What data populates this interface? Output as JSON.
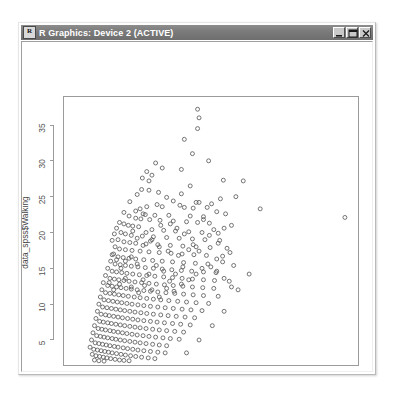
{
  "window": {
    "title": "R Graphics: Device 2 (ACTIVE)",
    "icon": "r-logo-icon",
    "controls": [
      {
        "name": "minimize-button",
        "glyph": "minimize-icon"
      },
      {
        "name": "maximize-button",
        "glyph": "maximize-icon"
      },
      {
        "name": "close-button",
        "glyph": "close-icon"
      }
    ]
  },
  "chart_data": {
    "type": "scatter",
    "title": "",
    "xlabel": "data_spss$Success",
    "ylabel": "data_spss$Walking",
    "xlim": [
      -12,
      388
    ],
    "ylim": [
      1.5,
      39
    ],
    "xticks": [
      0,
      50,
      100,
      150,
      200,
      250,
      300,
      350
    ],
    "yticks": [
      5,
      10,
      15,
      20,
      25,
      30,
      35
    ],
    "grid": false,
    "legend": null,
    "marker": "open-circle",
    "marker_color": "#5a5a5a",
    "points": [
      [
        170,
        37.2
      ],
      [
        172,
        36.0
      ],
      [
        170,
        34.5
      ],
      [
        152,
        33.0
      ],
      [
        163,
        31.0
      ],
      [
        185,
        30.0
      ],
      [
        113,
        29.7
      ],
      [
        122,
        29.0
      ],
      [
        148,
        28.8
      ],
      [
        101,
        28.5
      ],
      [
        108,
        28.0
      ],
      [
        95,
        27.6
      ],
      [
        104,
        27.2
      ],
      [
        205,
        27.3
      ],
      [
        232,
        27.2
      ],
      [
        160,
        26.5
      ],
      [
        94,
        26.0
      ],
      [
        104,
        25.9
      ],
      [
        88,
        25.3
      ],
      [
        222,
        25.0
      ],
      [
        201,
        24.7
      ],
      [
        78,
        24.3
      ],
      [
        168,
        24.2
      ],
      [
        172,
        24.2
      ],
      [
        189,
        24.0
      ],
      [
        146,
        23.8
      ],
      [
        115,
        23.9
      ],
      [
        101,
        23.6
      ],
      [
        122,
        23.6
      ],
      [
        152,
        23.5
      ],
      [
        164,
        23.4
      ],
      [
        183,
        23.5
      ],
      [
        255,
        23.3
      ],
      [
        370,
        22.1
      ],
      [
        196,
        22.9
      ],
      [
        208,
        22.6
      ],
      [
        96,
        22.6
      ],
      [
        99,
        22.5
      ],
      [
        112,
        22.4
      ],
      [
        131,
        22.4
      ],
      [
        160,
        22.3
      ],
      [
        178,
        22.2
      ],
      [
        86,
        22.0
      ],
      [
        93,
        21.9
      ],
      [
        105,
        21.8
      ],
      [
        119,
        21.7
      ],
      [
        137,
        21.6
      ],
      [
        155,
        21.5
      ],
      [
        170,
        21.4
      ],
      [
        186,
        21.3
      ],
      [
        216,
        21.0
      ],
      [
        70,
        21.2
      ],
      [
        76,
        21.0
      ],
      [
        82,
        20.9
      ],
      [
        90,
        20.8
      ],
      [
        108,
        20.4
      ],
      [
        124,
        20.3
      ],
      [
        140,
        20.2
      ],
      [
        158,
        20.1
      ],
      [
        176,
        20.0
      ],
      [
        198,
        19.9
      ],
      [
        66,
        20.0
      ],
      [
        72,
        19.8
      ],
      [
        80,
        19.6
      ],
      [
        95,
        19.5
      ],
      [
        110,
        19.4
      ],
      [
        128,
        19.3
      ],
      [
        145,
        19.2
      ],
      [
        163,
        19.1
      ],
      [
        180,
        19.0
      ],
      [
        200,
        18.9
      ],
      [
        62,
        19.0
      ],
      [
        70,
        18.7
      ],
      [
        78,
        18.6
      ],
      [
        86,
        18.5
      ],
      [
        100,
        18.4
      ],
      [
        116,
        18.3
      ],
      [
        133,
        18.2
      ],
      [
        150,
        18.1
      ],
      [
        168,
        18.0
      ],
      [
        187,
        17.9
      ],
      [
        210,
        17.8
      ],
      [
        58,
        18.0
      ],
      [
        64,
        17.7
      ],
      [
        72,
        17.6
      ],
      [
        81,
        17.5
      ],
      [
        92,
        17.4
      ],
      [
        104,
        17.3
      ],
      [
        118,
        17.2
      ],
      [
        134,
        17.1
      ],
      [
        149,
        17.0
      ],
      [
        165,
        16.9
      ],
      [
        182,
        16.8
      ],
      [
        204,
        16.7
      ],
      [
        56,
        17.0
      ],
      [
        62,
        16.6
      ],
      [
        69,
        16.5
      ],
      [
        77,
        16.4
      ],
      [
        86,
        16.3
      ],
      [
        97,
        16.2
      ],
      [
        109,
        16.1
      ],
      [
        122,
        16.0
      ],
      [
        136,
        15.9
      ],
      [
        151,
        15.8
      ],
      [
        167,
        15.7
      ],
      [
        184,
        15.6
      ],
      [
        219,
        15.4
      ],
      [
        52,
        16.0
      ],
      [
        58,
        15.6
      ],
      [
        65,
        15.5
      ],
      [
        72,
        15.4
      ],
      [
        80,
        15.3
      ],
      [
        89,
        15.2
      ],
      [
        99,
        15.1
      ],
      [
        110,
        15.0
      ],
      [
        122,
        14.9
      ],
      [
        135,
        14.8
      ],
      [
        148,
        14.7
      ],
      [
        162,
        14.6
      ],
      [
        178,
        14.5
      ],
      [
        195,
        14.4
      ],
      [
        240,
        14.2
      ],
      [
        48,
        15.0
      ],
      [
        54,
        14.6
      ],
      [
        60,
        14.5
      ],
      [
        67,
        14.4
      ],
      [
        74,
        14.3
      ],
      [
        82,
        14.2
      ],
      [
        91,
        14.1
      ],
      [
        101,
        14.0
      ],
      [
        112,
        13.9
      ],
      [
        124,
        13.8
      ],
      [
        136,
        13.7
      ],
      [
        149,
        13.6
      ],
      [
        163,
        13.5
      ],
      [
        178,
        13.4
      ],
      [
        193,
        13.3
      ],
      [
        213,
        13.2
      ],
      [
        45,
        14.0
      ],
      [
        51,
        13.6
      ],
      [
        57,
        13.5
      ],
      [
        63,
        13.4
      ],
      [
        70,
        13.3
      ],
      [
        77,
        13.2
      ],
      [
        85,
        13.1
      ],
      [
        94,
        13.0
      ],
      [
        104,
        12.9
      ],
      [
        114,
        12.8
      ],
      [
        125,
        12.7
      ],
      [
        137,
        12.6
      ],
      [
        150,
        12.5
      ],
      [
        163,
        12.4
      ],
      [
        177,
        12.3
      ],
      [
        192,
        12.2
      ],
      [
        225,
        12.0
      ],
      [
        42,
        13.0
      ],
      [
        48,
        12.6
      ],
      [
        54,
        12.5
      ],
      [
        60,
        12.4
      ],
      [
        66,
        12.3
      ],
      [
        73,
        12.2
      ],
      [
        80,
        12.1
      ],
      [
        88,
        12.0
      ],
      [
        97,
        11.9
      ],
      [
        106,
        11.8
      ],
      [
        116,
        11.7
      ],
      [
        127,
        11.6
      ],
      [
        139,
        11.5
      ],
      [
        151,
        11.4
      ],
      [
        164,
        11.3
      ],
      [
        178,
        11.2
      ],
      [
        198,
        11.1
      ],
      [
        40,
        12.0
      ],
      [
        45,
        11.6
      ],
      [
        51,
        11.5
      ],
      [
        57,
        11.4
      ],
      [
        63,
        11.3
      ],
      [
        69,
        11.2
      ],
      [
        76,
        11.1
      ],
      [
        84,
        11.0
      ],
      [
        92,
        10.9
      ],
      [
        101,
        10.8
      ],
      [
        110,
        10.7
      ],
      [
        120,
        10.6
      ],
      [
        131,
        10.5
      ],
      [
        143,
        10.4
      ],
      [
        155,
        10.3
      ],
      [
        168,
        10.2
      ],
      [
        185,
        10.1
      ],
      [
        38,
        11.0
      ],
      [
        43,
        10.6
      ],
      [
        49,
        10.5
      ],
      [
        55,
        10.4
      ],
      [
        61,
        10.3
      ],
      [
        67,
        10.2
      ],
      [
        74,
        10.1
      ],
      [
        81,
        10.0
      ],
      [
        89,
        9.9
      ],
      [
        97,
        9.8
      ],
      [
        106,
        9.7
      ],
      [
        116,
        9.6
      ],
      [
        126,
        9.5
      ],
      [
        137,
        9.4
      ],
      [
        149,
        9.3
      ],
      [
        161,
        9.2
      ],
      [
        176,
        9.1
      ],
      [
        206,
        9.0
      ],
      [
        36,
        10.0
      ],
      [
        41,
        9.6
      ],
      [
        47,
        9.5
      ],
      [
        53,
        9.4
      ],
      [
        59,
        9.3
      ],
      [
        65,
        9.2
      ],
      [
        71,
        9.1
      ],
      [
        78,
        9.0
      ],
      [
        85,
        8.9
      ],
      [
        93,
        8.8
      ],
      [
        101,
        8.7
      ],
      [
        110,
        8.6
      ],
      [
        120,
        8.5
      ],
      [
        130,
        8.4
      ],
      [
        141,
        8.3
      ],
      [
        153,
        8.2
      ],
      [
        166,
        8.1
      ],
      [
        34,
        9.0
      ],
      [
        39,
        8.6
      ],
      [
        45,
        8.5
      ],
      [
        50,
        8.4
      ],
      [
        56,
        8.3
      ],
      [
        62,
        8.2
      ],
      [
        68,
        8.1
      ],
      [
        75,
        8.0
      ],
      [
        82,
        7.9
      ],
      [
        89,
        7.8
      ],
      [
        97,
        7.7
      ],
      [
        106,
        7.6
      ],
      [
        115,
        7.5
      ],
      [
        125,
        7.4
      ],
      [
        136,
        7.3
      ],
      [
        147,
        7.2
      ],
      [
        160,
        7.1
      ],
      [
        190,
        7.0
      ],
      [
        32,
        8.0
      ],
      [
        37,
        7.6
      ],
      [
        42,
        7.5
      ],
      [
        48,
        7.4
      ],
      [
        53,
        7.3
      ],
      [
        59,
        7.2
      ],
      [
        65,
        7.1
      ],
      [
        71,
        7.0
      ],
      [
        78,
        6.9
      ],
      [
        85,
        6.8
      ],
      [
        92,
        6.7
      ],
      [
        100,
        6.6
      ],
      [
        109,
        6.5
      ],
      [
        118,
        6.4
      ],
      [
        128,
        6.3
      ],
      [
        139,
        6.2
      ],
      [
        151,
        6.1
      ],
      [
        30,
        7.0
      ],
      [
        35,
        6.6
      ],
      [
        40,
        6.5
      ],
      [
        45,
        6.4
      ],
      [
        51,
        6.3
      ],
      [
        56,
        6.2
      ],
      [
        62,
        6.1
      ],
      [
        68,
        6.0
      ],
      [
        74,
        5.9
      ],
      [
        81,
        5.8
      ],
      [
        88,
        5.7
      ],
      [
        96,
        5.6
      ],
      [
        104,
        5.5
      ],
      [
        113,
        5.4
      ],
      [
        123,
        5.3
      ],
      [
        133,
        5.2
      ],
      [
        145,
        5.1
      ],
      [
        172,
        5.0
      ],
      [
        28,
        6.0
      ],
      [
        33,
        5.6
      ],
      [
        38,
        5.5
      ],
      [
        43,
        5.4
      ],
      [
        48,
        5.3
      ],
      [
        54,
        5.2
      ],
      [
        59,
        5.1
      ],
      [
        65,
        5.0
      ],
      [
        71,
        4.9
      ],
      [
        78,
        4.8
      ],
      [
        85,
        4.7
      ],
      [
        92,
        4.6
      ],
      [
        100,
        4.5
      ],
      [
        109,
        4.4
      ],
      [
        118,
        4.3
      ],
      [
        128,
        4.2
      ],
      [
        26,
        5.0
      ],
      [
        31,
        4.6
      ],
      [
        36,
        4.5
      ],
      [
        41,
        4.4
      ],
      [
        46,
        4.3
      ],
      [
        51,
        4.2
      ],
      [
        57,
        4.1
      ],
      [
        62,
        4.0
      ],
      [
        69,
        3.9
      ],
      [
        75,
        3.8
      ],
      [
        82,
        3.7
      ],
      [
        89,
        3.6
      ],
      [
        97,
        3.5
      ],
      [
        106,
        3.4
      ],
      [
        116,
        3.3
      ],
      [
        126,
        3.2
      ],
      [
        155,
        3.2
      ],
      [
        24,
        4.0
      ],
      [
        29,
        3.7
      ],
      [
        34,
        3.6
      ],
      [
        39,
        3.5
      ],
      [
        44,
        3.4
      ],
      [
        49,
        3.3
      ],
      [
        54,
        3.2
      ],
      [
        60,
        3.1
      ],
      [
        66,
        3.0
      ],
      [
        72,
        2.9
      ],
      [
        79,
        2.8
      ],
      [
        86,
        2.7
      ],
      [
        94,
        2.6
      ],
      [
        103,
        2.5
      ],
      [
        112,
        2.4
      ],
      [
        27,
        3.0
      ],
      [
        32,
        2.8
      ],
      [
        37,
        2.7
      ],
      [
        42,
        2.6
      ],
      [
        47,
        2.5
      ],
      [
        52,
        2.4
      ],
      [
        58,
        2.3
      ],
      [
        64,
        2.2
      ],
      [
        70,
        2.15
      ],
      [
        77,
        2.1
      ],
      [
        30,
        2.2
      ],
      [
        36,
        2.1
      ],
      [
        43,
        2.05
      ],
      [
        196,
        16.3
      ],
      [
        204,
        15.9
      ],
      [
        214,
        17.2
      ],
      [
        198,
        18.5
      ],
      [
        186,
        19.6
      ],
      [
        192,
        20.4
      ],
      [
        178,
        21.8
      ],
      [
        206,
        20.6
      ],
      [
        148,
        25.4
      ],
      [
        137,
        24.4
      ],
      [
        128,
        24.9
      ],
      [
        117,
        25.6
      ],
      [
        86,
        23.0
      ],
      [
        92,
        23.3
      ],
      [
        77,
        22.3
      ],
      [
        70,
        22.8
      ],
      [
        64,
        21.4
      ],
      [
        60,
        20.6
      ],
      [
        57,
        19.8
      ],
      [
        54,
        18.9
      ],
      [
        120,
        21.0
      ],
      [
        133,
        21.2
      ],
      [
        142,
        20.6
      ],
      [
        152,
        19.8
      ],
      [
        108,
        19.0
      ],
      [
        96,
        18.2
      ],
      [
        88,
        19.2
      ],
      [
        82,
        20.2
      ],
      [
        164,
        18.3
      ],
      [
        172,
        17.4
      ],
      [
        158,
        17.6
      ],
      [
        144,
        16.8
      ],
      [
        130,
        17.4
      ],
      [
        118,
        18.0
      ],
      [
        106,
        18.8
      ],
      [
        100,
        20.0
      ],
      [
        206,
        13.6
      ],
      [
        216,
        12.4
      ],
      [
        196,
        14.6
      ],
      [
        188,
        15.2
      ],
      [
        176,
        15.0
      ],
      [
        168,
        14.2
      ],
      [
        158,
        13.4
      ],
      [
        150,
        15.2
      ],
      [
        140,
        14.2
      ],
      [
        132,
        13.2
      ],
      [
        124,
        14.6
      ],
      [
        114,
        15.4
      ],
      [
        104,
        14.2
      ],
      [
        96,
        13.4
      ],
      [
        88,
        15.6
      ],
      [
        80,
        16.6
      ],
      [
        72,
        16.0
      ],
      [
        66,
        15.0
      ],
      [
        60,
        16.2
      ],
      [
        54,
        16.9
      ],
      [
        50,
        13.0
      ],
      [
        56,
        12.0
      ],
      [
        64,
        12.8
      ],
      [
        72,
        13.6
      ],
      [
        80,
        12.4
      ],
      [
        90,
        11.6
      ],
      [
        98,
        12.6
      ],
      [
        108,
        12.0
      ],
      [
        118,
        11.0
      ],
      [
        128,
        12.2
      ],
      [
        138,
        11.8
      ],
      [
        148,
        12.8
      ]
    ]
  }
}
